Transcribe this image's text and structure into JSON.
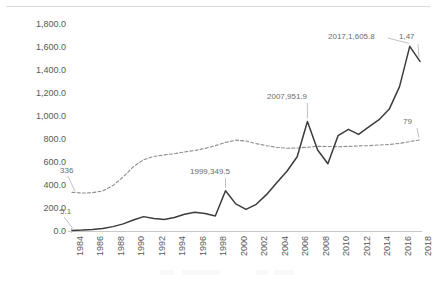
{
  "chart_data": {
    "type": "line",
    "title": "",
    "xlabel": "",
    "ylabel": "",
    "ylim": [
      0,
      1800
    ],
    "ytick_labels": [
      "1,800.0",
      "1,600.0",
      "1,400.0",
      "1,200.0",
      "1,000.0",
      "800.0",
      "600.0",
      "400.0",
      "200.0",
      "0.0"
    ],
    "ytick_values": [
      1800,
      1600,
      1400,
      1200,
      1000,
      800,
      600,
      400,
      200,
      0
    ],
    "grid": false,
    "legend": "none",
    "x": [
      1984,
      1985,
      1986,
      1987,
      1988,
      1989,
      1990,
      1991,
      1992,
      1993,
      1994,
      1995,
      1996,
      1997,
      1998,
      1999,
      2000,
      2001,
      2002,
      2003,
      2004,
      2005,
      2006,
      2007,
      2008,
      2009,
      2010,
      2011,
      2012,
      2013,
      2014,
      2015,
      2016,
      2017,
      2018
    ],
    "xtick_labels": [
      "1984",
      "1986",
      "1988",
      "1990",
      "1992",
      "1994",
      "1996",
      "1998",
      "2000",
      "2002",
      "2004",
      "2006",
      "2008",
      "2010",
      "2012",
      "2014",
      "2016",
      "2018"
    ],
    "xtick_values": [
      1984,
      1986,
      1988,
      1990,
      1992,
      1994,
      1996,
      1998,
      2000,
      2002,
      2004,
      2006,
      2008,
      2010,
      2012,
      2014,
      2016,
      2018
    ],
    "series": [
      {
        "name": "solid-series",
        "style": "solid",
        "color": "#3c3c3c",
        "values": [
          5.1,
          8.0,
          14.0,
          22.0,
          38.0,
          62.0,
          95.0,
          125.0,
          108.0,
          100.0,
          118.0,
          145.0,
          163.0,
          152.0,
          130.0,
          349.5,
          236.0,
          188.0,
          232.0,
          316.0,
          420.0,
          520.0,
          646.0,
          951.9,
          705.0,
          585.0,
          830.0,
          884.0,
          840.0,
          905.0,
          968.0,
          1060.0,
          1255.0,
          1605.8,
          1475.0
        ]
      },
      {
        "name": "dashed-series",
        "style": "dashed",
        "color": "#8d8d8d",
        "values": [
          336.0,
          330.0,
          333.0,
          348.0,
          395.0,
          470.0,
          560.0,
          620.0,
          648.0,
          662.0,
          672.0,
          688.0,
          700.0,
          718.0,
          742.0,
          770.0,
          790.0,
          782.0,
          760.0,
          742.0,
          728.0,
          720.0,
          722.0,
          728.0,
          736.0,
          735.0,
          733.0,
          736.0,
          740.0,
          742.0,
          748.0,
          752.0,
          762.0,
          778.0,
          792.0
        ]
      }
    ],
    "annotations": [
      {
        "name": "dashed-start-label",
        "text": "336",
        "value": 336.0,
        "year": 1984
      },
      {
        "name": "solid-start-label",
        "text": "5.1",
        "value": 5.1,
        "year": 1984
      },
      {
        "name": "solid-1999-label",
        "text": "1999,349.5",
        "value": 349.5,
        "year": 1999
      },
      {
        "name": "solid-2007-label",
        "text": "2007,951.9",
        "value": 951.9,
        "year": 2007
      },
      {
        "name": "solid-2017-label",
        "text": "2017,1,605.8",
        "value": 1605.8,
        "year": 2017
      },
      {
        "name": "solid-2018-label",
        "text": "1,47",
        "value": 1475.0,
        "year": 2018,
        "clipped": true
      },
      {
        "name": "dashed-end-label",
        "text": "79",
        "value": 792.0,
        "year": 2018,
        "clipped": true
      }
    ]
  }
}
